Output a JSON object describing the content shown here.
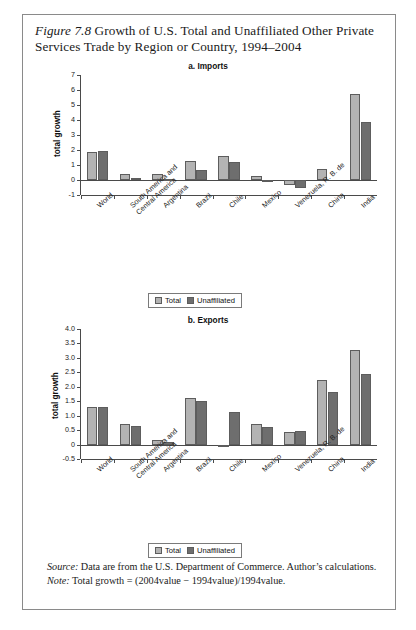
{
  "figure": {
    "label": "Figure 7.8",
    "title_rest": " Growth of U.S. Total and Unaffiliated Other Private Services Trade by Region or Country, 1994–2004"
  },
  "legend": {
    "total_label": "Total",
    "unaffiliated_label": "Unaffiliated"
  },
  "colors": {
    "total": "#b3b3b3",
    "unaffiliated": "#6e6e6e",
    "axis": "#4a4a4a",
    "frame": "#8a8a8a"
  },
  "notes": {
    "source_label": "Source:",
    "source_text": " Data are from the U.S. Department of Commerce. Author’s calculations.",
    "note_label": "Note:",
    "note_text": " Total growth = (2004value − 1994value)/1994value."
  },
  "chart_data": [
    {
      "type": "bar",
      "title": "a. Imports",
      "xlabel": "",
      "ylabel": "total growth",
      "ylim": [
        -1,
        7
      ],
      "yticks": [
        -1,
        0,
        1,
        2,
        3,
        4,
        5,
        6,
        7
      ],
      "ytick_labels": [
        "-1",
        "0",
        "1",
        "2",
        "3",
        "4",
        "5",
        "6",
        "7"
      ],
      "grid": false,
      "legend_position": "bottom-center",
      "categories": [
        "World",
        "South America and Central America",
        "Argentina",
        "Brazil",
        "Chile",
        "Mexico",
        "Venezuela, R. B. de",
        "China",
        "India"
      ],
      "series": [
        {
          "name": "Total",
          "values": [
            1.88,
            0.42,
            0.38,
            1.27,
            1.58,
            0.28,
            -0.35,
            0.72,
            5.75
          ]
        },
        {
          "name": "Unaffiliated",
          "values": [
            1.93,
            0.11,
            0.08,
            0.7,
            1.18,
            -0.06,
            -0.52,
            0.0,
            3.85
          ]
        }
      ]
    },
    {
      "type": "bar",
      "title": "b. Exports",
      "xlabel": "",
      "ylabel": "total growth",
      "ylim": [
        -0.5,
        4.0
      ],
      "yticks": [
        -0.5,
        0,
        0.5,
        1.0,
        1.5,
        2.0,
        2.5,
        3.0,
        3.5,
        4.0
      ],
      "ytick_labels": [
        "-0.5",
        "0",
        "0.5",
        "1.0",
        "1.5",
        "2.0",
        "2.5",
        "3.0",
        "3.5",
        "4.0"
      ],
      "grid": false,
      "legend_position": "bottom-center",
      "categories": [
        "World",
        "South America and Central America",
        "Argentina",
        "Brazil",
        "Chile",
        "Mexico",
        "Venezuela, R. B. de",
        "China",
        "India"
      ],
      "series": [
        {
          "name": "Total",
          "values": [
            1.3,
            0.72,
            0.17,
            1.61,
            -0.05,
            0.72,
            0.45,
            2.24,
            3.26
          ]
        },
        {
          "name": "Unaffiliated",
          "values": [
            1.3,
            0.64,
            0.09,
            1.52,
            1.12,
            0.61,
            0.47,
            1.83,
            2.44
          ]
        }
      ]
    }
  ]
}
